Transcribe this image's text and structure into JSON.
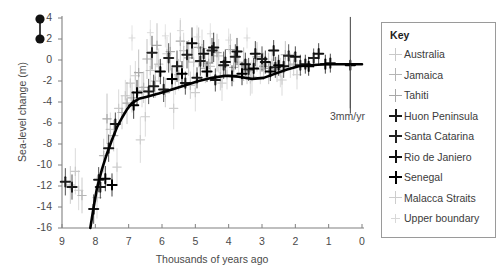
{
  "chart_data": {
    "type": "scatter",
    "title": "",
    "xlabel": "Thousands of years ago",
    "ylabel": "Sea-level change (m)",
    "xlim": [
      9,
      0
    ],
    "ylim": [
      -16,
      4
    ],
    "x_reversed": true,
    "grid": false,
    "xticks": [
      9,
      8,
      7,
      6,
      5,
      4,
      3,
      2,
      1,
      0
    ],
    "yticks": [
      4,
      2,
      0,
      -2,
      -4,
      -6,
      -8,
      -10,
      -12,
      -14,
      -16
    ],
    "xtick_labels": [
      "9",
      "8",
      "7",
      "6",
      "5",
      "4",
      "3",
      "2",
      "1",
      "0"
    ],
    "ytick_labels": [
      "4",
      "2",
      "0",
      "-2",
      "-4",
      "-6",
      "-8",
      "-10",
      "-12",
      "-14",
      "-16"
    ],
    "legend_position": "right-outside",
    "annotations": [
      {
        "name": "rate-annotation",
        "text": "3mm/yr",
        "x": 0.35,
        "y": -5.2,
        "bar_from_y": 0.0,
        "bar_to_y": -4.6,
        "bar_x": 0.35
      }
    ],
    "series": [
      {
        "name": "Australia",
        "marker": "plus",
        "color": "#c9c9c9",
        "weight": "light",
        "points": [
          {
            "x": 8.6,
            "y": -10.6,
            "err": 2.2
          },
          {
            "x": 8.5,
            "y": -12.4,
            "err": 1.9
          },
          {
            "x": 7.55,
            "y": -6.6,
            "err": 1.6
          },
          {
            "x": 7.3,
            "y": -4.6,
            "err": 1.8
          },
          {
            "x": 7.1,
            "y": -3.4,
            "err": 1.5
          },
          {
            "x": 6.95,
            "y": -2.2,
            "err": 1.7
          },
          {
            "x": 6.8,
            "y": -1.5,
            "err": 1.4
          },
          {
            "x": 6.6,
            "y": -2.9,
            "err": 1.6
          },
          {
            "x": 6.35,
            "y": -1.0,
            "err": 1.9
          },
          {
            "x": 6.1,
            "y": -0.4,
            "err": 1.5
          },
          {
            "x": 5.85,
            "y": 0.6,
            "err": 1.6
          },
          {
            "x": 5.6,
            "y": -1.9,
            "err": 1.4
          },
          {
            "x": 5.35,
            "y": 0.9,
            "err": 1.7
          },
          {
            "x": 5.05,
            "y": -0.2,
            "err": 1.5
          },
          {
            "x": 4.8,
            "y": 1.1,
            "err": 1.8
          },
          {
            "x": 4.55,
            "y": -0.6,
            "err": 1.5
          },
          {
            "x": 4.3,
            "y": 0.4,
            "err": 1.6
          },
          {
            "x": 4.05,
            "y": -1.4,
            "err": 1.4
          },
          {
            "x": 3.7,
            "y": -0.2,
            "err": 1.5
          },
          {
            "x": 3.35,
            "y": -1.8,
            "err": 1.6
          },
          {
            "x": 3.05,
            "y": -0.9,
            "err": 1.4
          },
          {
            "x": 2.7,
            "y": -0.3,
            "err": 1.3
          },
          {
            "x": 2.45,
            "y": -1.2,
            "err": 1.4
          },
          {
            "x": 2.15,
            "y": -0.5,
            "err": 1.2
          }
        ]
      },
      {
        "name": "Jamaica",
        "marker": "plus",
        "color": "#b5b5b5",
        "weight": "light",
        "points": [
          {
            "x": 8.75,
            "y": -11.9,
            "err": 1.8
          },
          {
            "x": 8.4,
            "y": -12.9,
            "err": 1.7
          },
          {
            "x": 7.75,
            "y": -9.1,
            "err": 1.6
          },
          {
            "x": 7.45,
            "y": -7.2,
            "err": 1.5
          },
          {
            "x": 7.2,
            "y": -5.0,
            "err": 1.6
          },
          {
            "x": 6.9,
            "y": -3.6,
            "err": 1.4
          },
          {
            "x": 6.55,
            "y": -2.6,
            "err": 1.5
          },
          {
            "x": 6.2,
            "y": -2.0,
            "err": 1.6
          },
          {
            "x": 5.9,
            "y": -3.1,
            "err": 1.4
          },
          {
            "x": 5.5,
            "y": -1.4,
            "err": 1.5
          },
          {
            "x": 5.15,
            "y": -2.4,
            "err": 1.3
          },
          {
            "x": 4.7,
            "y": -0.8,
            "err": 1.4
          },
          {
            "x": 4.25,
            "y": -1.6,
            "err": 1.3
          },
          {
            "x": 3.85,
            "y": -0.7,
            "err": 1.4
          },
          {
            "x": 3.45,
            "y": -1.1,
            "err": 1.2
          },
          {
            "x": 2.95,
            "y": -0.6,
            "err": 1.3
          },
          {
            "x": 2.55,
            "y": -0.9,
            "err": 1.2
          },
          {
            "x": 2.05,
            "y": -0.4,
            "err": 1.1
          }
        ]
      },
      {
        "name": "Tahiti",
        "marker": "plus",
        "color": "#a8a8a8",
        "weight": "light",
        "points": [
          {
            "x": 7.65,
            "y": -5.6,
            "err": 2.4
          },
          {
            "x": 7.05,
            "y": -4.1,
            "err": 2.0
          },
          {
            "x": 6.7,
            "y": -1.2,
            "err": 2.2
          },
          {
            "x": 6.45,
            "y": 0.1,
            "err": 1.9
          },
          {
            "x": 6.15,
            "y": 1.4,
            "err": 2.1
          },
          {
            "x": 5.75,
            "y": 0.8,
            "err": 1.8
          },
          {
            "x": 5.45,
            "y": 1.8,
            "err": 2.0
          },
          {
            "x": 5.2,
            "y": 0.2,
            "err": 1.7
          },
          {
            "x": 4.9,
            "y": 1.2,
            "err": 1.9
          },
          {
            "x": 4.6,
            "y": -0.3,
            "err": 1.6
          },
          {
            "x": 4.35,
            "y": 0.7,
            "err": 1.8
          },
          {
            "x": 3.95,
            "y": 1.0,
            "err": 1.5
          },
          {
            "x": 3.55,
            "y": -0.4,
            "err": 1.6
          },
          {
            "x": 3.15,
            "y": 0.3,
            "err": 1.4
          },
          {
            "x": 2.8,
            "y": -0.8,
            "err": 1.5
          },
          {
            "x": 2.3,
            "y": 0.5,
            "err": 1.3
          }
        ]
      },
      {
        "name": "Huon Peninsula",
        "marker": "plus",
        "color": "#1a1a1a",
        "weight": "bold",
        "points": [
          {
            "x": 8.9,
            "y": -11.6,
            "err": 1.3
          },
          {
            "x": 8.7,
            "y": -12.1,
            "err": 1.2
          },
          {
            "x": 8.05,
            "y": -14.2,
            "err": 1.4
          },
          {
            "x": 7.9,
            "y": -11.4,
            "err": 1.2
          },
          {
            "x": 7.85,
            "y": -12.1,
            "err": 1.1
          },
          {
            "x": 7.6,
            "y": -8.4,
            "err": 1.3
          },
          {
            "x": 7.4,
            "y": -6.1,
            "err": 1.1
          },
          {
            "x": 6.4,
            "y": -3.0,
            "err": 1.2
          },
          {
            "x": 6.25,
            "y": -2.5,
            "err": 1.1
          },
          {
            "x": 5.95,
            "y": -2.8,
            "err": 1.2
          },
          {
            "x": 5.3,
            "y": -2.2,
            "err": 1.1
          },
          {
            "x": 4.95,
            "y": -1.7,
            "err": 1.0
          },
          {
            "x": 4.4,
            "y": -1.9,
            "err": 1.1
          },
          {
            "x": 3.9,
            "y": -1.5,
            "err": 1.0
          }
        ]
      },
      {
        "name": "Santa Catarina",
        "marker": "plus",
        "color": "#222222",
        "weight": "bold",
        "points": [
          {
            "x": 6.3,
            "y": 0.7,
            "err": 1.6
          },
          {
            "x": 5.8,
            "y": 0.2,
            "err": 1.4
          },
          {
            "x": 5.55,
            "y": -0.6,
            "err": 1.5
          },
          {
            "x": 5.25,
            "y": 0.5,
            "err": 1.3
          },
          {
            "x": 4.85,
            "y": -0.1,
            "err": 1.4
          },
          {
            "x": 4.5,
            "y": 0.9,
            "err": 1.2
          },
          {
            "x": 4.15,
            "y": -0.5,
            "err": 1.3
          },
          {
            "x": 3.8,
            "y": 0.3,
            "err": 1.2
          },
          {
            "x": 3.4,
            "y": -0.9,
            "err": 1.1
          },
          {
            "x": 3.0,
            "y": 0.1,
            "err": 1.2
          },
          {
            "x": 2.6,
            "y": -0.7,
            "err": 1.0
          },
          {
            "x": 2.2,
            "y": 0.4,
            "err": 1.1
          },
          {
            "x": 1.85,
            "y": -0.5,
            "err": 1.0
          },
          {
            "x": 1.45,
            "y": 0.2,
            "err": 0.9
          }
        ]
      },
      {
        "name": "Rio de Janiero",
        "marker": "plus",
        "color": "#111111",
        "weight": "bold",
        "points": [
          {
            "x": 5.1,
            "y": 1.6,
            "err": 1.5
          },
          {
            "x": 4.75,
            "y": 0.6,
            "err": 1.3
          },
          {
            "x": 4.45,
            "y": 1.2,
            "err": 1.4
          },
          {
            "x": 4.1,
            "y": -0.2,
            "err": 1.2
          },
          {
            "x": 3.75,
            "y": 0.8,
            "err": 1.3
          },
          {
            "x": 3.5,
            "y": -0.4,
            "err": 1.1
          },
          {
            "x": 3.2,
            "y": 0.6,
            "err": 1.2
          },
          {
            "x": 2.9,
            "y": -0.2,
            "err": 1.1
          },
          {
            "x": 2.65,
            "y": 0.9,
            "err": 1.0
          },
          {
            "x": 2.35,
            "y": -0.6,
            "err": 1.1
          },
          {
            "x": 2.0,
            "y": 0.3,
            "err": 1.0
          },
          {
            "x": 1.7,
            "y": -0.4,
            "err": 0.9
          },
          {
            "x": 1.3,
            "y": 0.6,
            "err": 1.0
          },
          {
            "x": 0.95,
            "y": -0.3,
            "err": 0.9
          }
        ]
      },
      {
        "name": "Senegal",
        "marker": "plus",
        "color": "#000000",
        "weight": "bold",
        "points": [
          {
            "x": 7.7,
            "y": -11.3,
            "err": 1.2
          },
          {
            "x": 7.5,
            "y": -11.9,
            "err": 1.1
          },
          {
            "x": 6.85,
            "y": -4.3,
            "err": 1.3
          },
          {
            "x": 6.75,
            "y": -3.1,
            "err": 1.2
          },
          {
            "x": 6.05,
            "y": -1.1,
            "err": 1.2
          },
          {
            "x": 5.7,
            "y": -1.8,
            "err": 1.1
          },
          {
            "x": 5.4,
            "y": -1.3,
            "err": 1.2
          },
          {
            "x": 4.65,
            "y": -1.1,
            "err": 1.0
          },
          {
            "x": 3.6,
            "y": -1.3,
            "err": 1.1
          },
          {
            "x": 3.25,
            "y": -0.8,
            "err": 1.0
          },
          {
            "x": 2.75,
            "y": -1.1,
            "err": 0.9
          },
          {
            "x": 2.5,
            "y": -0.5,
            "err": 1.0
          },
          {
            "x": 1.6,
            "y": -0.6,
            "err": 0.9
          },
          {
            "x": 1.1,
            "y": -0.4,
            "err": 0.9
          },
          {
            "x": 0.35,
            "y": -0.5,
            "err": 4.6
          }
        ]
      },
      {
        "name": "Malacca Straits",
        "marker": "plus",
        "color": "#cdcdcd",
        "weight": "light",
        "points": [
          {
            "x": 7.95,
            "y": -13.1,
            "err": 2.0
          },
          {
            "x": 7.35,
            "y": -10.2,
            "err": 1.8
          },
          {
            "x": 6.65,
            "y": -7.6,
            "err": 2.2
          },
          {
            "x": 6.5,
            "y": -5.4,
            "err": 1.9
          },
          {
            "x": 5.65,
            "y": -4.6,
            "err": 2.0
          },
          {
            "x": 5.0,
            "y": -3.1,
            "err": 1.8
          },
          {
            "x": 4.2,
            "y": -2.2,
            "err": 1.7
          },
          {
            "x": 3.3,
            "y": -1.6,
            "err": 1.6
          },
          {
            "x": 2.4,
            "y": -1.9,
            "err": 1.5
          },
          {
            "x": 1.95,
            "y": -1.4,
            "err": 1.4
          }
        ]
      },
      {
        "name": "Upper boundary",
        "marker": "plus-small",
        "color": "#d8d8d8",
        "weight": "faint",
        "points": [
          {
            "x": 6.9,
            "y": 2.1,
            "err": 1.2
          },
          {
            "x": 6.35,
            "y": 2.6,
            "err": 1.2
          },
          {
            "x": 5.9,
            "y": 2.3,
            "err": 1.1
          },
          {
            "x": 5.45,
            "y": 2.8,
            "err": 1.2
          },
          {
            "x": 4.95,
            "y": 2.2,
            "err": 1.1
          },
          {
            "x": 4.55,
            "y": 2.5,
            "err": 1.0
          },
          {
            "x": 4.0,
            "y": 1.9,
            "err": 1.1
          },
          {
            "x": 3.45,
            "y": 2.1,
            "err": 1.0
          }
        ]
      }
    ],
    "fit_curve": {
      "name": "Mean sea-level curve",
      "color": "#000000",
      "width": 2.6,
      "points": [
        {
          "x": 8.15,
          "y": -16.0
        },
        {
          "x": 8.05,
          "y": -14.0
        },
        {
          "x": 7.95,
          "y": -12.2
        },
        {
          "x": 7.8,
          "y": -10.4
        },
        {
          "x": 7.65,
          "y": -8.9
        },
        {
          "x": 7.5,
          "y": -7.6
        },
        {
          "x": 7.35,
          "y": -6.4
        },
        {
          "x": 7.2,
          "y": -5.5
        },
        {
          "x": 7.05,
          "y": -4.7
        },
        {
          "x": 6.9,
          "y": -4.1
        },
        {
          "x": 6.7,
          "y": -3.7
        },
        {
          "x": 6.45,
          "y": -3.5
        },
        {
          "x": 6.1,
          "y": -3.2
        },
        {
          "x": 5.7,
          "y": -2.8
        },
        {
          "x": 5.3,
          "y": -2.4
        },
        {
          "x": 4.9,
          "y": -2.0
        },
        {
          "x": 4.5,
          "y": -1.7
        },
        {
          "x": 4.1,
          "y": -1.5
        },
        {
          "x": 3.7,
          "y": -1.6
        },
        {
          "x": 3.3,
          "y": -1.8
        },
        {
          "x": 2.95,
          "y": -1.7
        },
        {
          "x": 2.6,
          "y": -1.3
        },
        {
          "x": 2.25,
          "y": -0.9
        },
        {
          "x": 1.9,
          "y": -0.6
        },
        {
          "x": 1.55,
          "y": -0.5
        },
        {
          "x": 1.1,
          "y": -0.4
        },
        {
          "x": 0.6,
          "y": -0.4
        },
        {
          "x": 0.0,
          "y": -0.4
        }
      ]
    },
    "corner_markers": {
      "name": "bullet-scale-markers",
      "color": "#111111",
      "points": [
        {
          "y": 3.9
        },
        {
          "y": 2.0
        }
      ]
    }
  },
  "legend": {
    "title": "Key",
    "items": [
      {
        "label": "Australia",
        "color": "#c9c9c9",
        "weight": "light"
      },
      {
        "label": "Jamaica",
        "color": "#b5b5b5",
        "weight": "light"
      },
      {
        "label": "Tahiti",
        "color": "#a8a8a8",
        "weight": "light"
      },
      {
        "label": "Huon Peninsula",
        "color": "#1a1a1a",
        "weight": "bold"
      },
      {
        "label": "Santa Catarina",
        "color": "#222222",
        "weight": "bold"
      },
      {
        "label": "Rio de Janiero",
        "color": "#111111",
        "weight": "bold"
      },
      {
        "label": "Senegal",
        "color": "#000000",
        "weight": "bold"
      },
      {
        "label": "Malacca Straits",
        "color": "#cdcdcd",
        "weight": "light"
      },
      {
        "label": "Upper boundary",
        "color": "#d8d8d8",
        "weight": "faint"
      }
    ]
  }
}
